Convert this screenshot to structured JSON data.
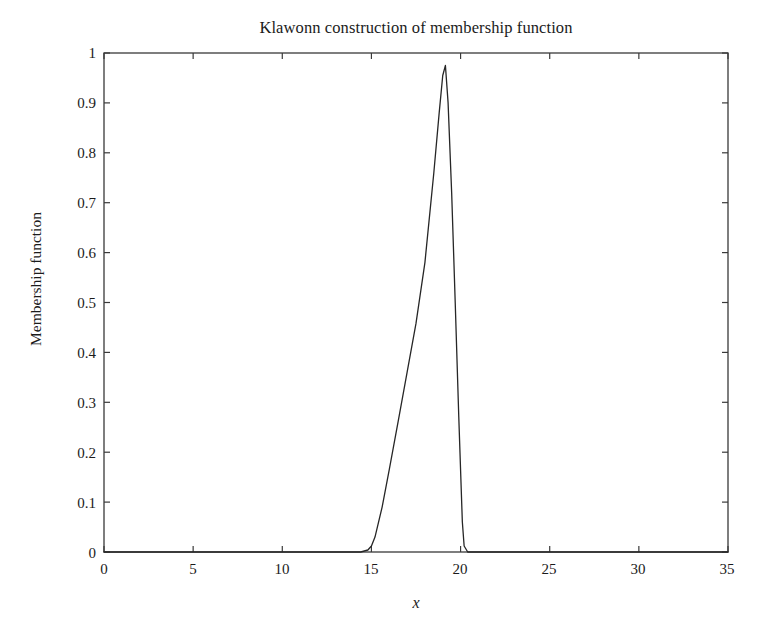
{
  "chart_data": {
    "type": "line",
    "title": "Klawonn construction of membership function",
    "xlabel": "x",
    "ylabel": "Membership function",
    "xlim": [
      0,
      35
    ],
    "ylim": [
      0,
      1
    ],
    "grid": false,
    "legend": null,
    "xticks": [
      0,
      5,
      10,
      15,
      20,
      25,
      30,
      35
    ],
    "xtick_labels": [
      "0",
      "5",
      "10",
      "15",
      "20",
      "25",
      "30",
      "35"
    ],
    "yticks": [
      0,
      0.1,
      0.2,
      0.3,
      0.4,
      0.5,
      0.6,
      0.7,
      0.8,
      0.9,
      1
    ],
    "ytick_labels": [
      "0",
      "0.1",
      "0.2",
      "0.3",
      "0.4",
      "0.5",
      "0.6",
      "0.7",
      "0.8",
      "0.9",
      "1"
    ],
    "line_color": "#262626",
    "line_width": 1.2,
    "series": [
      {
        "name": "membership function",
        "x": [
          0,
          2,
          4,
          6,
          8,
          10,
          12,
          13,
          14,
          14.4,
          14.8,
          15.0,
          15.2,
          15.6,
          16.0,
          16.5,
          17.0,
          17.5,
          18.0,
          18.5,
          18.8,
          19.0,
          19.15,
          19.3,
          19.5,
          19.7,
          19.9,
          20.1,
          20.2,
          20.4,
          21,
          22,
          24,
          26,
          28,
          30,
          32,
          34,
          35
        ],
        "y": [
          0,
          0,
          0,
          0,
          0,
          0,
          0,
          0,
          0,
          0,
          0.004,
          0.012,
          0.03,
          0.09,
          0.165,
          0.262,
          0.36,
          0.458,
          0.58,
          0.76,
          0.88,
          0.955,
          0.975,
          0.9,
          0.72,
          0.5,
          0.27,
          0.06,
          0.012,
          0,
          0,
          0,
          0,
          0,
          0,
          0,
          0,
          0,
          0
        ]
      }
    ],
    "annotations": {
      "peak_x": 19.15,
      "peak_y": 0.975,
      "support_left": 14.8,
      "support_right": 20.3
    }
  },
  "axes": {
    "box_color": "#3a3a3a",
    "background": "#ffffff"
  }
}
